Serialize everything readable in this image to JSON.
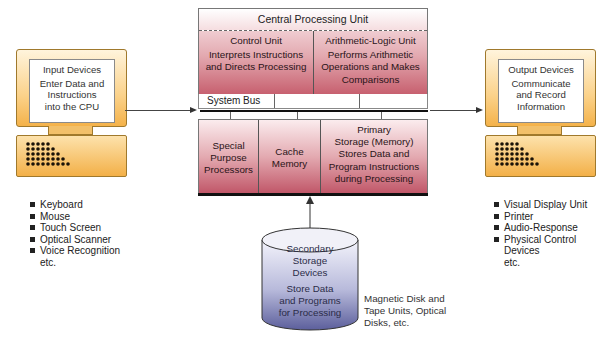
{
  "input": {
    "title": "Input Devices",
    "lines": [
      "Enter Data and",
      "Instructions",
      "into the CPU"
    ],
    "examples": [
      "Keyboard",
      "Mouse",
      "Touch Screen",
      "Optical Scanner",
      "Voice Recognition"
    ],
    "etc": "etc."
  },
  "cpu": {
    "title": "Central Processing Unit",
    "control_unit": {
      "title": "Control Unit",
      "lines": [
        "Interprets Instructions",
        "and Directs Processing"
      ]
    },
    "alu": {
      "title": "Arithmetic-Logic Unit",
      "lines": [
        "Performs Arithmetic",
        "Operations and Makes",
        "Comparisons"
      ]
    }
  },
  "bus": {
    "label": "System Bus"
  },
  "lower": {
    "special": [
      "Special",
      "Purpose",
      "Processors"
    ],
    "cache": [
      "Cache",
      "Memory"
    ],
    "primary": [
      "Primary",
      "Storage (Memory)",
      "Stores Data and",
      "Program Instructions",
      "during Processing"
    ]
  },
  "secondary": {
    "title_lines": [
      "Secondary",
      "Storage",
      "Devices"
    ],
    "desc_lines": [
      "Store Data",
      "and Programs",
      "for Processing"
    ],
    "note_lines": [
      "Magnetic Disk and",
      "Tape Units, Optical",
      "Disks, etc."
    ]
  },
  "output": {
    "title": "Output Devices",
    "lines": [
      "Communicate",
      "and Record",
      "Information"
    ],
    "examples": [
      "Visual Display Unit",
      "Printer",
      "Audio-Response",
      "Physical Control",
      "Devices"
    ],
    "etc": "etc."
  },
  "colors": {
    "cpu_dark": "#c05567",
    "cpu_light": "#fbecee",
    "computer_orange": "#f4b24a",
    "storage_blue": "#5c5f9c"
  }
}
